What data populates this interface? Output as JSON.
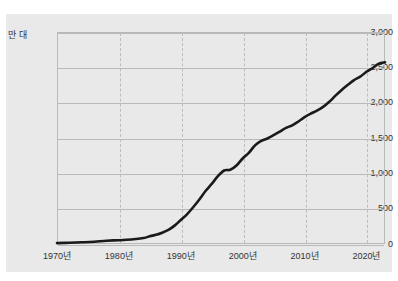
{
  "chart_data": {
    "type": "line",
    "title": "",
    "subtitle": "",
    "xlabel": "",
    "ylabel": "",
    "yunit": "만 대",
    "xlim": [
      1970,
      2023
    ],
    "ylim": [
      0,
      3000
    ],
    "grid": true,
    "legend": false,
    "line_color": "#1a1a1a",
    "panel_color": "#e9e9e9",
    "grid_color": "#b9b9b9",
    "y_ticks": [
      "0",
      "500",
      "1,000",
      "1,500",
      "2,000",
      "2,500",
      "3,000"
    ],
    "y_tick_values": [
      0,
      500,
      1000,
      1500,
      2000,
      2500,
      3000
    ],
    "x_ticks": [
      "1970년",
      "1980년",
      "1990년",
      "2000년",
      "2010년",
      "2020년"
    ],
    "x_tick_values": [
      1970,
      1980,
      1990,
      2000,
      2010,
      2020
    ],
    "series": [
      {
        "name": "자동차 등록대수",
        "x": [
          1970,
          1972,
          1974,
          1976,
          1978,
          1980,
          1982,
          1984,
          1985,
          1986,
          1987,
          1988,
          1989,
          1990,
          1991,
          1992,
          1993,
          1994,
          1995,
          1996,
          1997,
          1998,
          1999,
          2000,
          2001,
          2002,
          2003,
          2004,
          2005,
          2006,
          2007,
          2008,
          2009,
          2010,
          2011,
          2012,
          2013,
          2014,
          2015,
          2016,
          2017,
          2018,
          2019,
          2020,
          2021,
          2022,
          2023
        ],
        "values": [
          13,
          18,
          24,
          32,
          47,
          53,
          63,
          85,
          110,
          130,
          160,
          200,
          260,
          340,
          420,
          520,
          630,
          750,
          850,
          960,
          1040,
          1050,
          1110,
          1210,
          1290,
          1395,
          1459,
          1493,
          1540,
          1590,
          1643,
          1679,
          1733,
          1794,
          1844,
          1887,
          1940,
          2012,
          2099,
          2180,
          2253,
          2320,
          2368,
          2437,
          2491,
          2550,
          2570
        ]
      }
    ]
  }
}
